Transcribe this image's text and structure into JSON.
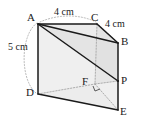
{
  "figure": {
    "kind": "geometry-diagram",
    "canvas": {
      "width": 142,
      "height": 130
    },
    "background_color": "#ffffff",
    "stroke_color": "#1a1a1a",
    "dotted_color": "#9a9a9a",
    "fill_light": "#f2f2f2",
    "fill_mid": "#e6e6e6",
    "fill_dark": "#dcdcdc",
    "vertices": [
      {
        "id": "A",
        "label": "A",
        "x": 38,
        "y": 24,
        "label_x": 27,
        "label_y": 13
      },
      {
        "id": "C",
        "label": "C",
        "x": 97,
        "y": 24,
        "label_x": 92,
        "label_y": 13
      },
      {
        "id": "B",
        "label": "B",
        "x": 118,
        "y": 43,
        "label_x": 121,
        "label_y": 38
      },
      {
        "id": "D",
        "label": "D",
        "x": 38,
        "y": 94,
        "label_x": 27,
        "label_y": 90
      },
      {
        "id": "F",
        "label": "F",
        "x": 95,
        "y": 84,
        "label_x": 83,
        "label_y": 77
      },
      {
        "id": "P",
        "label": "P",
        "x": 118,
        "y": 81,
        "label_x": 121,
        "label_y": 76
      },
      {
        "id": "E",
        "label": "E",
        "x": 118,
        "y": 110,
        "label_x": 121,
        "label_y": 108
      }
    ],
    "dimensions": [
      {
        "id": "top",
        "text": "4 cm",
        "edge": "A-C",
        "label_x": 55,
        "label_y": 8
      },
      {
        "id": "right",
        "text": "4 cm",
        "edge": "C-B",
        "label_x": 106,
        "label_y": 20
      },
      {
        "id": "left",
        "text": "5 cm",
        "edge": "A-D",
        "label_x": 9,
        "label_y": 42
      }
    ],
    "solid_edges": [
      {
        "from": "A",
        "to": "C"
      },
      {
        "from": "A",
        "to": "B"
      },
      {
        "from": "A",
        "to": "D"
      },
      {
        "from": "A",
        "to": "P"
      },
      {
        "from": "C",
        "to": "B"
      },
      {
        "from": "D",
        "to": "E"
      },
      {
        "from": "B",
        "to": "E"
      },
      {
        "from": "P",
        "to": "E"
      },
      {
        "from": "B",
        "to": "P"
      }
    ],
    "hidden_edges": [
      {
        "from": "C",
        "to": "F"
      },
      {
        "from": "D",
        "to": "F"
      },
      {
        "from": "F",
        "to": "P"
      },
      {
        "from": "F",
        "to": "E"
      }
    ],
    "right_angle_marker": {
      "at": "F",
      "size": 5
    }
  }
}
